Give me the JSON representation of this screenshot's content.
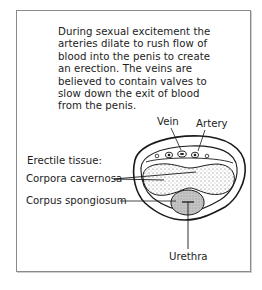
{
  "figure": {
    "caption": "During sexual excitement the arteries dilate to rush flow of blood into the penis to create an erection. The veins are believed to contain valves to slow down the exit of blood from the penis.",
    "labels": {
      "vein": "Vein",
      "artery": "Artery",
      "erectile_tissue": "Erectile tissue:",
      "corpora_cavernosa": "Corpora cavernosa",
      "corpus_spongiosum": "Corpus spongiosum",
      "urethra": "Urethra"
    },
    "colors": {
      "line": "#1a1a1a",
      "stipple": "#555555",
      "spongiosum_fill": "#bdbdbd",
      "frame": "#8a8a8a"
    }
  }
}
